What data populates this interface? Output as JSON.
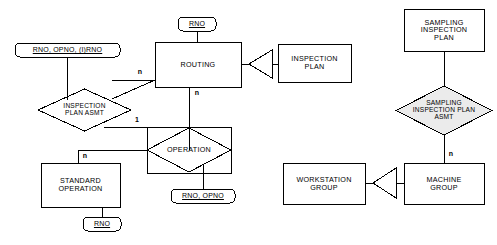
{
  "diagram": {
    "notation": "Chen ER with associative entity and subtype triangle connectors",
    "colors": {
      "stroke": "#000000",
      "fill": "#ffffff",
      "text": "#000000",
      "shaded_fill": "#ebebeb"
    },
    "entities": [
      {
        "id": "routing",
        "label": "ROUTING",
        "shape": "rectangle",
        "x": 155,
        "y": 42,
        "w": 86,
        "h": 45
      },
      {
        "id": "inspection-plan",
        "label": "INSPECTION\nPLAN",
        "shape": "rectangle",
        "x": 278,
        "y": 44,
        "w": 73,
        "h": 38
      },
      {
        "id": "sampling-inspection-plan",
        "label": "SAMPLING\nINSPECTION\nPLAN",
        "shape": "rectangle",
        "x": 404,
        "y": 9,
        "w": 80,
        "h": 42
      },
      {
        "id": "standard-operation",
        "label": "STANDARD\nOPERATION",
        "shape": "rectangle",
        "x": 41,
        "y": 163,
        "w": 79,
        "h": 44
      },
      {
        "id": "workstation-group",
        "label": "WORKSTATION\nGROUP",
        "shape": "rectangle",
        "x": 283,
        "y": 163,
        "w": 82,
        "h": 41
      },
      {
        "id": "machine-group",
        "label": "MACHINE\nGROUP",
        "shape": "rectangle",
        "x": 404,
        "y": 163,
        "w": 80,
        "h": 41
      }
    ],
    "associative_entities": [
      {
        "id": "operation",
        "label": "OPERATION",
        "shape": "diamond-in-rectangle",
        "x": 147,
        "y": 127,
        "w": 84,
        "h": 46
      }
    ],
    "relationships": [
      {
        "id": "inspection-plan-asmt",
        "label": "INSPECTION\nPLAN ASMT",
        "shape": "diamond",
        "x": 38,
        "y": 89,
        "w": 93,
        "h": 42
      },
      {
        "id": "sampling-inspection-plan-asmt",
        "label": "SAMPLING\nINSPECTION PLAN\nASMT",
        "shape": "diamond",
        "x": 396,
        "y": 86,
        "w": 96,
        "h": 49
      }
    ],
    "attributes": [
      {
        "id": "routing-key",
        "label": "RNO",
        "key": true,
        "x": 178,
        "y": 17,
        "w": 38,
        "h": 14
      },
      {
        "id": "inspection-plan-asmt-key",
        "label": "RNO, OPNO, (I)RNO",
        "key": true,
        "x": 15,
        "y": 43,
        "w": 105,
        "h": 14
      },
      {
        "id": "operation-key",
        "label": "RNO, OPNO",
        "key": true,
        "x": 171,
        "y": 189,
        "w": 64,
        "h": 14
      },
      {
        "id": "standard-operation-key",
        "label": "RNO",
        "key": true,
        "x": 83,
        "y": 217,
        "w": 38,
        "h": 14
      }
    ],
    "cardinalities": [
      {
        "id": "card-routing-left",
        "label": "n",
        "x": 140,
        "y": 72
      },
      {
        "id": "card-routing-bottom",
        "label": "n",
        "x": 192,
        "y": 92
      },
      {
        "id": "card-operation-left",
        "label": "1",
        "x": 136,
        "y": 119
      },
      {
        "id": "card-standard-operation",
        "label": "n",
        "x": 79,
        "y": 148
      },
      {
        "id": "card-machine-group",
        "label": "n",
        "x": 441,
        "y": 148
      }
    ],
    "connectors": [
      {
        "id": "triangle-routing-inspection-plan",
        "type": "subtype-triangle",
        "points": "left"
      },
      {
        "id": "triangle-workstation-machine",
        "type": "subtype-triangle",
        "points": "left"
      }
    ]
  }
}
